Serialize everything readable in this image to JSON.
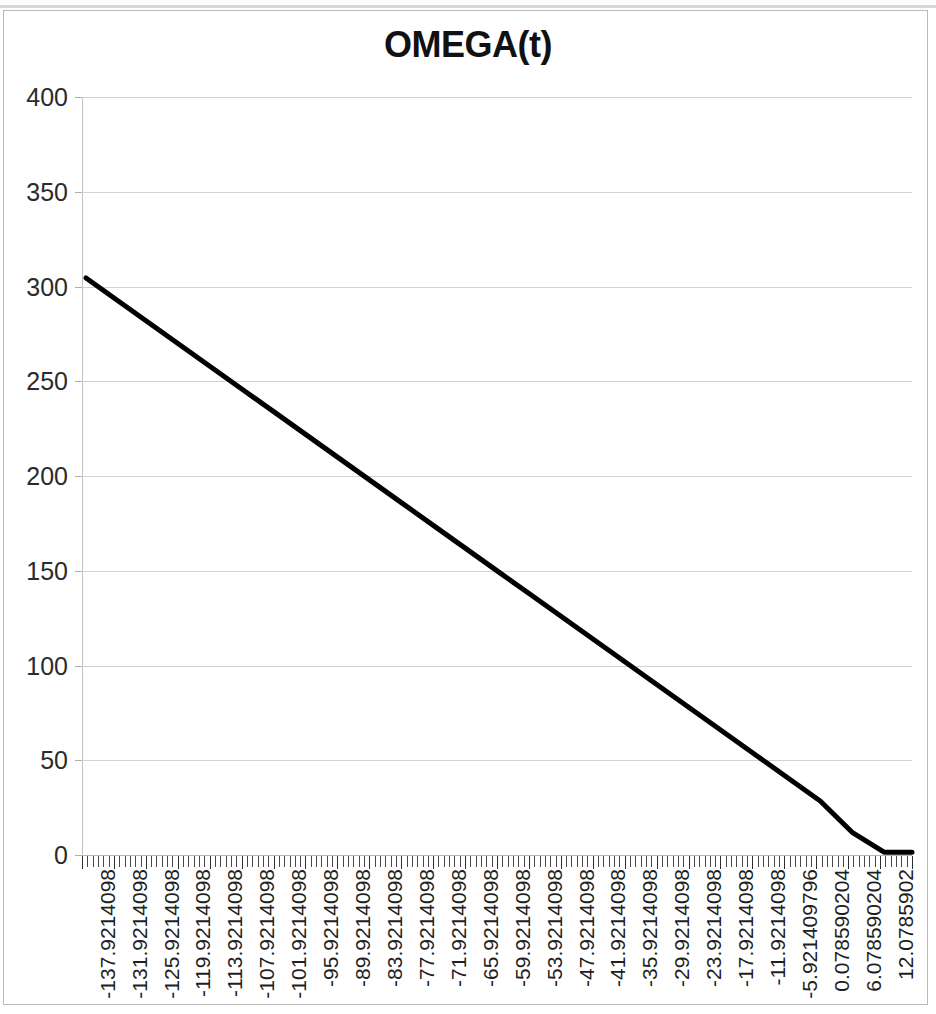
{
  "chart_data": {
    "type": "line",
    "title": "OMEGA(t)",
    "xlabel": "",
    "ylabel": "",
    "ylim": [
      0,
      400
    ],
    "y_ticks": [
      0,
      50,
      100,
      150,
      200,
      250,
      300,
      350,
      400
    ],
    "grid": true,
    "legend": false,
    "legend_position": "none",
    "line_color": "#000000",
    "x_tick_labels": [
      "-137.9214098",
      "-131.9214098",
      "-125.9214098",
      "-119.9214098",
      "-113.9214098",
      "-107.9214098",
      "-101.9214098",
      "-95.9214098",
      "-89.9214098",
      "-83.9214098",
      "-77.9214098",
      "-71.9214098",
      "-65.9214098",
      "-59.9214098",
      "-53.9214098",
      "-47.9214098",
      "-41.9214098",
      "-35.9214098",
      "-29.9214098",
      "-23.9214098",
      "-17.9214098",
      "-11.9214098",
      "-5.921409796",
      "0.078590204",
      "6.078590204",
      "12.0785902"
    ],
    "x": [
      -137.9214098,
      -131.9214098,
      -125.9214098,
      -119.9214098,
      -113.9214098,
      -107.9214098,
      -101.9214098,
      -95.9214098,
      -89.9214098,
      -83.9214098,
      -77.9214098,
      -71.9214098,
      -65.9214098,
      -59.9214098,
      -53.9214098,
      -47.9214098,
      -41.9214098,
      -35.9214098,
      -29.9214098,
      -23.9214098,
      -17.9214098,
      -11.9214098,
      -5.921409796,
      0.078590204,
      6.078590204,
      12.0785902
    ],
    "values": [
      304.5,
      292.5,
      280.5,
      268.5,
      256.5,
      244.5,
      232.5,
      220.5,
      208.5,
      196.5,
      184.5,
      172.5,
      160.5,
      148.5,
      136.5,
      124.5,
      112.5,
      100.5,
      88.5,
      76.5,
      64.5,
      52.5,
      40.5,
      28.5,
      12.0,
      1.5
    ],
    "series": [
      {
        "name": "OMEGA(t)",
        "values": [
          304.5,
          292.5,
          280.5,
          268.5,
          256.5,
          244.5,
          232.5,
          220.5,
          208.5,
          196.5,
          184.5,
          172.5,
          160.5,
          148.5,
          136.5,
          124.5,
          112.5,
          100.5,
          88.5,
          76.5,
          64.5,
          52.5,
          40.5,
          28.5,
          12.0,
          1.5
        ]
      }
    ],
    "x_minor_ticks_per_label": 6
  }
}
